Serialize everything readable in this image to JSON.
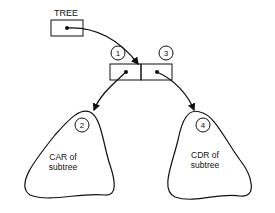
{
  "root": {
    "label": "TREE"
  },
  "cell": {
    "car_number": "1",
    "cdr_number": "3"
  },
  "subtrees": [
    {
      "number": "2",
      "line1": "CAR of",
      "line2": "subtree"
    },
    {
      "number": "4",
      "line1": "CDR of",
      "line2": "subtree"
    }
  ]
}
